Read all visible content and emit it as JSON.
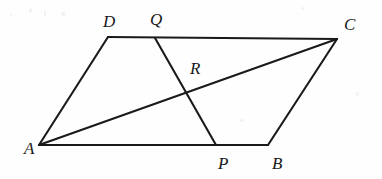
{
  "figure": {
    "background_color": "#fefefe",
    "stroke_color": "#1a1a1c",
    "label_color": "#18181a",
    "canvas": {
      "width": 382,
      "height": 179
    },
    "points": [
      {
        "id": "A",
        "label": "A",
        "x": 39,
        "y": 145,
        "label_x": 24,
        "label_y": 140
      },
      {
        "id": "B",
        "label": "B",
        "x": 268,
        "y": 145,
        "label_x": 272,
        "label_y": 155
      },
      {
        "id": "C",
        "label": "C",
        "x": 337,
        "y": 39,
        "label_x": 344,
        "label_y": 16
      },
      {
        "id": "D",
        "label": "D",
        "x": 108,
        "y": 37,
        "label_x": 103,
        "label_y": 13
      },
      {
        "id": "P",
        "label": "P",
        "x": 216,
        "y": 145,
        "label_x": 218,
        "label_y": 155
      },
      {
        "id": "Q",
        "label": "Q",
        "x": 155,
        "y": 38,
        "label_x": 150,
        "label_y": 11
      },
      {
        "id": "R",
        "label": "R",
        "x": 187,
        "y": 89,
        "label_x": 190,
        "label_y": 60
      }
    ],
    "segments": [
      {
        "id": "AB",
        "from": "A",
        "to": "B",
        "name": "side-ab"
      },
      {
        "id": "BC",
        "from": "B",
        "to": "C",
        "name": "side-bc"
      },
      {
        "id": "CD",
        "from": "C",
        "to": "D",
        "name": "side-cd"
      },
      {
        "id": "DA",
        "from": "D",
        "to": "A",
        "name": "side-da"
      },
      {
        "id": "AC",
        "from": "A",
        "to": "C",
        "name": "diagonal-ac"
      },
      {
        "id": "QP",
        "from": "Q",
        "to": "P",
        "name": "segment-qp"
      }
    ],
    "labels": {
      "A": "A",
      "B": "B",
      "C": "C",
      "D": "D",
      "P": "P",
      "Q": "Q",
      "R": "R"
    },
    "stroke_width": 2.1
  }
}
